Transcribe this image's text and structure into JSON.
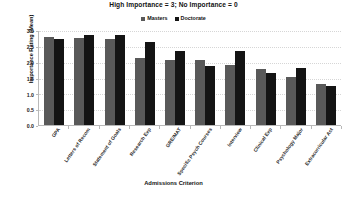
{
  "chart_data": {
    "type": "bar",
    "title": "High Importance = 3; No Importance = 0",
    "xlabel": "Admissions Criterion",
    "ylabel": "Importance Rating (Mean)",
    "ylim": [
      0.0,
      3.0
    ],
    "ytick_labels": [
      "3.0",
      "2.5",
      "2.0",
      "1.5",
      "1.0",
      "0.5",
      "0.0"
    ],
    "ytick_values": [
      3.0,
      2.5,
      2.0,
      1.5,
      1.0,
      0.5,
      0.0
    ],
    "grid": true,
    "legend_position": "top-center",
    "categories": [
      "GPA",
      "Letters of Recom",
      "Statement of Goals",
      "Research Exp",
      "GRE/MAT",
      "Specific Psych Courses",
      "Interview",
      "Clinical Exp",
      "Psychology Major",
      "Extracurricular Act"
    ],
    "series": [
      {
        "name": "Masters",
        "color": "#595959",
        "values": [
          2.78,
          2.76,
          2.71,
          2.11,
          2.04,
          2.04,
          1.91,
          1.78,
          1.52,
          1.31
        ]
      },
      {
        "name": "Doctorate",
        "color": "#141414",
        "values": [
          2.72,
          2.85,
          2.84,
          2.62,
          2.34,
          1.86,
          2.34,
          1.63,
          1.79,
          1.24
        ]
      }
    ]
  },
  "figure": {
    "source_note": ""
  }
}
